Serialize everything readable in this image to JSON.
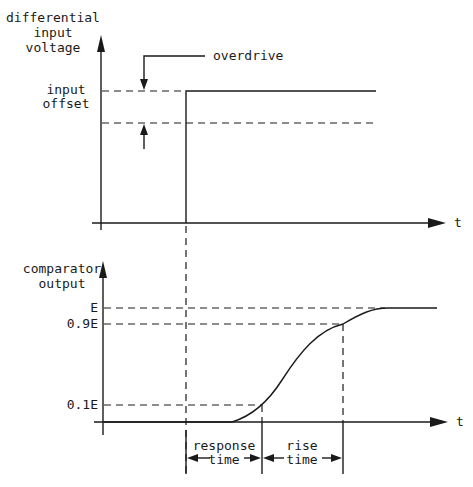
{
  "diagram": {
    "top_panel": {
      "y_axis_label": [
        "differential",
        "input",
        "voltage"
      ],
      "x_axis_label": "t",
      "level_label": [
        "input",
        "offset"
      ],
      "annotation": "overdrive"
    },
    "bottom_panel": {
      "y_axis_label": [
        "comparator",
        "output"
      ],
      "x_axis_label": "t",
      "levels": [
        "E",
        "0.9E",
        "0.1E"
      ],
      "intervals": [
        {
          "label": [
            "response",
            "time"
          ]
        },
        {
          "label": [
            "rise",
            "time"
          ]
        }
      ]
    },
    "colors": {
      "ink": "#1a1a1a",
      "background": "#ffffff"
    }
  }
}
